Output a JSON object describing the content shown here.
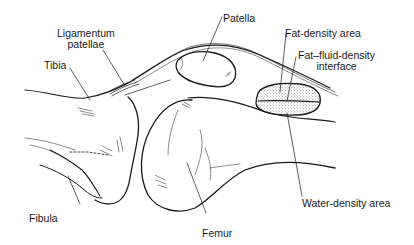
{
  "diagram": {
    "type": "anatomical-illustration",
    "labels": {
      "ligamentum_patellae_line1": "Ligamentum",
      "ligamentum_patellae_line2": "patellae",
      "patella": "Patella",
      "tibia": "Tibia",
      "fat_density_area": "Fat-density area",
      "fat_fluid_interface_line1": "Fat–fluid-density",
      "fat_fluid_interface_line2": "interface",
      "water_density_area": "Water-density area",
      "fibula": "Fibula",
      "femur": "Femur"
    },
    "colors": {
      "line": "#1a1a1a",
      "background": "#ffffff",
      "stipple": "#555555"
    }
  }
}
